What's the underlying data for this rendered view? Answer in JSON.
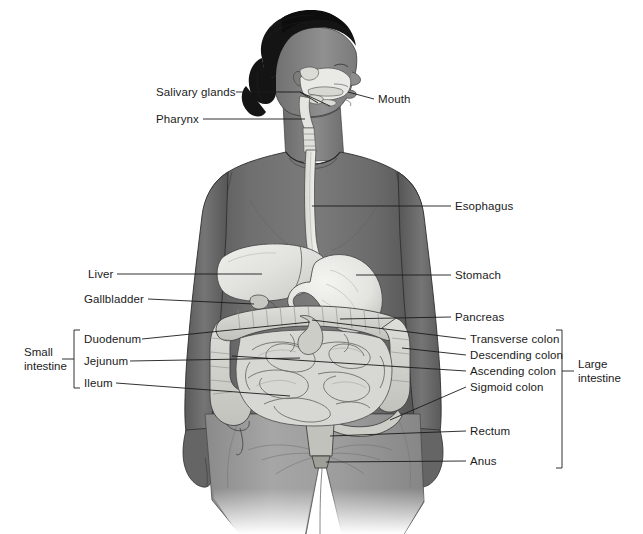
{
  "diagram": {
    "style": {
      "background": "#ffffff",
      "line_color": "#1b1b1b",
      "text_color": "#1b1b1b",
      "hair_color": "#141414",
      "skin_mid": "#8c8c8c",
      "skin_dark": "#5f5f5f",
      "shirt_color": "#6e6e6e",
      "shorts_color": "#9a9a9a",
      "organ_light": "#e8e8e4",
      "organ_mid": "#cfcfca",
      "organ_dark": "#b3b3ae"
    },
    "labels_left": [
      {
        "name": "salivary-glands",
        "text": "Salivary glands",
        "x": 156,
        "y": 86
      },
      {
        "name": "pharynx",
        "text": "Pharynx",
        "x": 156,
        "y": 113
      },
      {
        "name": "liver",
        "text": "Liver",
        "x": 88,
        "y": 268
      },
      {
        "name": "gallbladder",
        "text": "Gallbladder",
        "x": 88,
        "y": 293
      }
    ],
    "labels_right": [
      {
        "name": "mouth",
        "text": "Mouth",
        "x": 378,
        "y": 94
      },
      {
        "name": "esophagus",
        "text": "Esophagus",
        "x": 455,
        "y": 200
      },
      {
        "name": "stomach",
        "text": "Stomach",
        "x": 455,
        "y": 269
      },
      {
        "name": "pancreas",
        "text": "Pancreas",
        "x": 455,
        "y": 311
      },
      {
        "name": "transverse-colon",
        "text": "Transverse colon",
        "x": 470,
        "y": 333
      },
      {
        "name": "descending-colon",
        "text": "Descending colon",
        "x": 470,
        "y": 349
      },
      {
        "name": "ascending-colon",
        "text": "Ascending colon",
        "x": 470,
        "y": 365
      },
      {
        "name": "sigmoid-colon",
        "text": "Sigmoid colon",
        "x": 470,
        "y": 381
      },
      {
        "name": "rectum",
        "text": "Rectum",
        "x": 470,
        "y": 425
      },
      {
        "name": "anus",
        "text": "Anus",
        "x": 470,
        "y": 455
      }
    ],
    "groups": {
      "small_intestine": {
        "name": "small-intestine",
        "line1": "Small",
        "line2": "intestine",
        "items": [
          {
            "name": "duodenum",
            "text": "Duodenum",
            "x": 84,
            "y": 333
          },
          {
            "name": "jejunum",
            "text": "Jejunum",
            "x": 84,
            "y": 355
          },
          {
            "name": "ileum",
            "text": "Ileum",
            "x": 84,
            "y": 377
          }
        ]
      },
      "large_intestine": {
        "name": "large-intestine",
        "line1": "Large",
        "line2": "intestine"
      }
    }
  }
}
